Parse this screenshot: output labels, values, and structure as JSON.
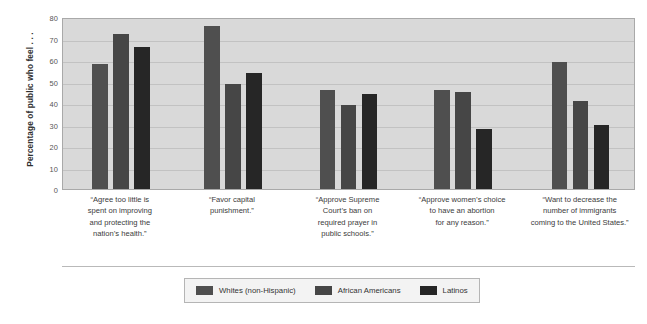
{
  "chart_data": {
    "type": "bar",
    "title": "",
    "subtitle": "",
    "xlabel": "",
    "ylabel": "Percentage of public who feel . . .",
    "ylim": [
      0,
      80
    ],
    "ytick_step": 10,
    "yticks": [
      "80",
      "70",
      "60",
      "50",
      "40",
      "30",
      "20",
      "10",
      "0"
    ],
    "grid": true,
    "legend_position": "bottom",
    "categories": [
      "“Agree too little is spent on improving and protecting the nation’s health.”",
      "“Favor capital punishment.”",
      "“Approve Supreme Court’s ban on required prayer in public schools.”",
      "“Approve women’s choice to have an abortion for any reason.”",
      "“Want to decrease the number of immigrants coming to the United States.”"
    ],
    "category_lines": [
      [
        "“Agree too little is",
        "spent on improving",
        "and protecting the",
        "nation’s health.”"
      ],
      [
        "“Favor capital",
        "punishment.”"
      ],
      [
        "“Approve Supreme",
        "Court’s ban on",
        "required prayer in",
        "public schools.”"
      ],
      [
        "“Approve women’s choice",
        "to have an abortion",
        "for any reason.”"
      ],
      [
        "“Want to decrease the",
        "number of immigrants",
        "coming to the United States.”"
      ]
    ],
    "series": [
      {
        "name": "Whites (non-Hispanic)",
        "color": "#4f4f4f",
        "values": [
          58,
          76,
          46,
          46,
          59
        ]
      },
      {
        "name": "African Americans",
        "color": "#464646",
        "values": [
          72,
          49,
          39,
          45,
          41
        ]
      },
      {
        "name": "Latinos",
        "color": "#262626",
        "values": [
          66,
          54,
          44,
          28,
          30
        ]
      }
    ]
  },
  "legend": {
    "items": [
      {
        "label": "Whites (non-Hispanic)",
        "color": "#4f4f4f"
      },
      {
        "label": "African Americans",
        "color": "#464646"
      },
      {
        "label": "Latinos",
        "color": "#262626"
      }
    ]
  },
  "colors": {
    "plot_background": "#d9d9d9",
    "gridline": "#c2c2c2",
    "plot_border": "#a9a9a9",
    "legend_background": "#f3f3f3",
    "legend_border": "#b5b5b5",
    "page_background": "#ffffff",
    "text": "#3a3a3a"
  }
}
